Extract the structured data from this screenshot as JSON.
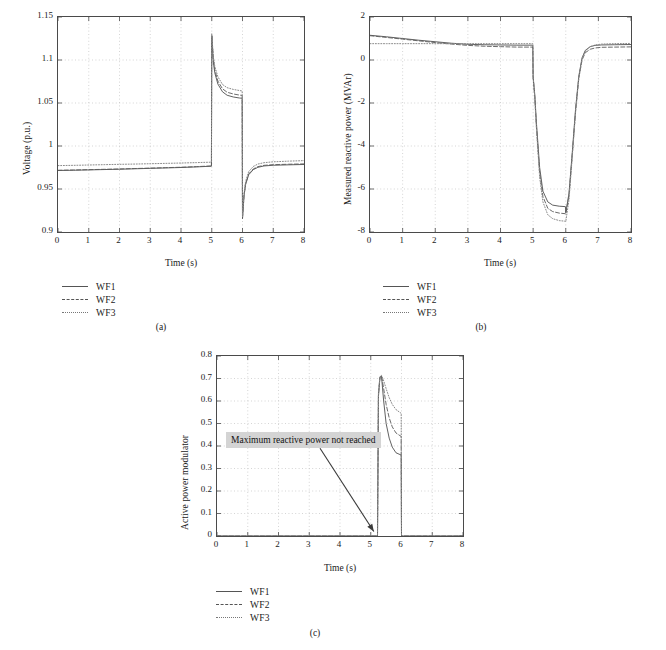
{
  "figure": {
    "subplot_captions": [
      "(a)",
      "(b)",
      "(c)"
    ]
  },
  "legend": {
    "entries": [
      {
        "label": "WF1",
        "style": "solid"
      },
      {
        "label": "WF2",
        "style": "dashed"
      },
      {
        "label": "WF3",
        "style": "dotted"
      }
    ]
  },
  "annotation": {
    "text": "Maximum reactive power not reached",
    "arrow_from": [
      3.35,
      0.39
    ],
    "arrow_to": [
      5.1,
      0.02
    ]
  },
  "chart_data": [
    {
      "type": "line",
      "id": "a",
      "title": "",
      "xlabel": "Time (s)",
      "ylabel": "Voltage (p.u.)",
      "xlim": [
        0,
        8
      ],
      "ylim": [
        0.9,
        1.15
      ],
      "xticks": [
        0,
        1,
        2,
        3,
        4,
        5,
        6,
        7,
        8
      ],
      "yticks": [
        0.9,
        0.95,
        1,
        1.05,
        1.1,
        1.15
      ],
      "ytick_labels": [
        "0.9",
        "0.95",
        "1",
        "1.05",
        "1.1",
        "1.15"
      ],
      "grid": true,
      "legend_position": "below-left",
      "series": [
        {
          "name": "WF1",
          "style": "solid",
          "x": [
            0,
            0.5,
            1,
            1.5,
            2,
            2.5,
            3,
            3.5,
            4,
            4.5,
            4.99,
            5.0,
            5.05,
            5.1,
            5.2,
            5.35,
            5.5,
            5.7,
            5.9,
            5.99,
            6.0,
            6.05,
            6.1,
            6.2,
            6.35,
            6.5,
            6.7,
            7.0,
            7.5,
            8
          ],
          "y": [
            0.9715,
            0.9718,
            0.9722,
            0.9726,
            0.973,
            0.9735,
            0.974,
            0.9745,
            0.975,
            0.9757,
            0.9765,
            1.128,
            1.098,
            1.085,
            1.072,
            1.063,
            1.059,
            1.057,
            1.0558,
            1.0555,
            0.9155,
            0.942,
            0.955,
            0.9665,
            0.9725,
            0.9752,
            0.9768,
            0.9776,
            0.9781,
            0.9785
          ]
        },
        {
          "name": "WF2",
          "style": "dashed",
          "x": [
            0,
            0.5,
            1,
            1.5,
            2,
            2.5,
            3,
            3.5,
            4,
            4.5,
            4.99,
            5.0,
            5.05,
            5.1,
            5.2,
            5.35,
            5.5,
            5.7,
            5.9,
            5.99,
            6.0,
            6.05,
            6.1,
            6.2,
            6.35,
            6.5,
            6.7,
            7.0,
            7.5,
            8
          ],
          "y": [
            0.9718,
            0.9721,
            0.9725,
            0.9729,
            0.9733,
            0.9738,
            0.9743,
            0.9748,
            0.9753,
            0.976,
            0.9768,
            1.129,
            1.1015,
            1.0885,
            1.0755,
            1.0665,
            1.0625,
            1.0605,
            1.0592,
            1.0588,
            0.9165,
            0.943,
            0.9562,
            0.9675,
            0.9733,
            0.976,
            0.9775,
            0.9783,
            0.9788,
            0.9792
          ]
        },
        {
          "name": "WF3",
          "style": "dotted",
          "x": [
            0,
            0.5,
            1,
            1.5,
            2,
            2.5,
            3,
            3.5,
            4,
            4.5,
            4.99,
            5.0,
            5.05,
            5.1,
            5.2,
            5.35,
            5.5,
            5.7,
            5.9,
            5.99,
            6.0,
            6.05,
            6.1,
            6.2,
            6.35,
            6.5,
            6.7,
            7.0,
            7.5,
            8
          ],
          "y": [
            0.9772,
            0.9775,
            0.9779,
            0.9783,
            0.9787,
            0.979,
            0.9794,
            0.9798,
            0.9802,
            0.9807,
            0.9812,
            1.1305,
            1.1045,
            1.0925,
            1.0805,
            1.0715,
            1.0678,
            1.0658,
            1.0645,
            1.064,
            0.9175,
            0.945,
            0.9585,
            0.9702,
            0.9762,
            0.979,
            0.9806,
            0.9816,
            0.9824,
            0.983
          ]
        }
      ]
    },
    {
      "type": "line",
      "id": "b",
      "title": "",
      "xlabel": "Time (s)",
      "ylabel": "Measured reactive power (MVAr)",
      "xlim": [
        0,
        8
      ],
      "ylim": [
        -8,
        2
      ],
      "xticks": [
        0,
        1,
        2,
        3,
        4,
        5,
        6,
        7,
        8
      ],
      "yticks": [
        -8,
        -6,
        -4,
        -2,
        0,
        2
      ],
      "ytick_labels": [
        "-8",
        "-6",
        "-4",
        "-2",
        "0",
        "2"
      ],
      "grid": true,
      "legend_position": "below-left",
      "series": [
        {
          "name": "WF1",
          "style": "solid",
          "x": [
            0,
            0.5,
            1,
            1.5,
            2,
            2.5,
            3,
            3.5,
            4,
            4.5,
            4.99,
            5.0,
            5.05,
            5.1,
            5.2,
            5.3,
            5.45,
            5.6,
            5.8,
            5.99,
            6.0,
            6.1,
            6.2,
            6.3,
            6.4,
            6.5,
            6.6,
            6.75,
            6.9,
            7.1,
            7.5,
            8
          ],
          "y": [
            1.15,
            1.08,
            1.0,
            0.92,
            0.85,
            0.78,
            0.73,
            0.71,
            0.7,
            0.69,
            0.69,
            -0.78,
            -1.6,
            -2.9,
            -5.0,
            -6.1,
            -6.6,
            -6.75,
            -6.8,
            -6.82,
            -7.1,
            -6.2,
            -4.3,
            -2.3,
            -0.75,
            0.1,
            0.45,
            0.62,
            0.68,
            0.7,
            0.71,
            0.72
          ]
        },
        {
          "name": "WF2",
          "style": "dashed",
          "x": [
            0,
            0.5,
            1,
            1.5,
            2,
            2.5,
            3,
            3.5,
            4,
            4.5,
            4.99,
            5.0,
            5.05,
            5.1,
            5.2,
            5.3,
            5.45,
            5.6,
            5.8,
            5.99,
            6.0,
            6.1,
            6.2,
            6.3,
            6.4,
            6.5,
            6.6,
            6.75,
            6.9,
            7.1,
            7.5,
            8
          ],
          "y": [
            1.13,
            1.05,
            0.97,
            0.89,
            0.81,
            0.74,
            0.68,
            0.64,
            0.62,
            0.6,
            0.6,
            -0.8,
            -1.7,
            -3.05,
            -5.25,
            -6.35,
            -6.9,
            -7.05,
            -7.12,
            -7.15,
            -7.18,
            -6.3,
            -4.4,
            -2.4,
            -0.85,
            0.0,
            0.34,
            0.5,
            0.56,
            0.59,
            0.6,
            0.61
          ]
        },
        {
          "name": "WF3",
          "style": "dotted",
          "x": [
            0,
            0.5,
            1,
            1.5,
            2,
            2.5,
            3,
            3.5,
            4,
            4.5,
            4.99,
            5.0,
            5.05,
            5.1,
            5.2,
            5.3,
            5.45,
            5.6,
            5.8,
            5.99,
            6.0,
            6.1,
            6.2,
            6.3,
            6.4,
            6.5,
            6.6,
            6.75,
            6.9,
            7.1,
            7.5,
            8
          ],
          "y": [
            0.76,
            0.76,
            0.76,
            0.76,
            0.76,
            0.76,
            0.76,
            0.76,
            0.76,
            0.76,
            0.76,
            -0.8,
            -1.75,
            -3.15,
            -5.45,
            -6.6,
            -7.2,
            -7.38,
            -7.47,
            -7.5,
            -7.52,
            -6.5,
            -4.5,
            -2.45,
            -0.85,
            0.05,
            0.42,
            0.62,
            0.7,
            0.74,
            0.76,
            0.77
          ]
        }
      ]
    },
    {
      "type": "line",
      "id": "c",
      "title": "",
      "xlabel": "Time (s)",
      "ylabel": "Active power modulator",
      "xlim": [
        0,
        8
      ],
      "ylim": [
        0,
        0.8
      ],
      "xticks": [
        0,
        1,
        2,
        3,
        4,
        5,
        6,
        7,
        8
      ],
      "yticks": [
        0,
        0.1,
        0.2,
        0.3,
        0.4,
        0.5,
        0.6,
        0.7,
        0.8
      ],
      "ytick_labels": [
        "0",
        "0.1",
        "0.2",
        "0.3",
        "0.4",
        "0.5",
        "0.6",
        "0.7",
        "0.8"
      ],
      "grid": true,
      "legend_position": "below-left",
      "series": [
        {
          "name": "WF1",
          "style": "solid",
          "x": [
            0,
            1,
            2,
            3,
            4,
            5,
            5.22,
            5.25,
            5.3,
            5.35,
            5.42,
            5.5,
            5.6,
            5.7,
            5.82,
            5.95,
            5.99,
            6.0,
            6.5,
            7,
            8
          ],
          "y": [
            0,
            0,
            0,
            0,
            0,
            0,
            0,
            0.62,
            0.705,
            0.71,
            0.6,
            0.5,
            0.435,
            0.395,
            0.37,
            0.362,
            0.36,
            0,
            0,
            0,
            0
          ]
        },
        {
          "name": "WF2",
          "style": "dashed",
          "x": [
            0,
            1,
            2,
            3,
            4,
            5,
            5.22,
            5.25,
            5.3,
            5.35,
            5.42,
            5.5,
            5.6,
            5.7,
            5.82,
            5.95,
            5.99,
            6.0,
            6.5,
            7,
            8
          ],
          "y": [
            0,
            0,
            0,
            0,
            0,
            0,
            0,
            0.63,
            0.707,
            0.712,
            0.655,
            0.585,
            0.525,
            0.485,
            0.458,
            0.446,
            0.443,
            0,
            0,
            0,
            0
          ]
        },
        {
          "name": "WF3",
          "style": "dotted",
          "x": [
            0,
            1,
            2,
            3,
            4,
            5,
            5.22,
            5.25,
            5.3,
            5.35,
            5.42,
            5.5,
            5.6,
            5.7,
            5.82,
            5.95,
            5.99,
            6.0,
            6.5,
            7,
            8
          ],
          "y": [
            0,
            0,
            0,
            0,
            0,
            0,
            0,
            0.64,
            0.709,
            0.714,
            0.69,
            0.655,
            0.615,
            0.585,
            0.562,
            0.549,
            0.545,
            0,
            0,
            0,
            0
          ]
        }
      ]
    }
  ]
}
